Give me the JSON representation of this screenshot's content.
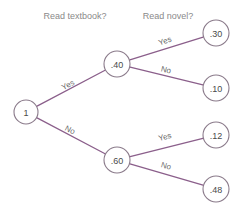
{
  "chart_data": {
    "type": "diagram",
    "diagram_kind": "probability-tree",
    "title": "",
    "column_headers": [
      {
        "label": "Read textbook?",
        "x": 75,
        "y": 17
      },
      {
        "label": "Read novel?",
        "x": 168,
        "y": 17
      }
    ],
    "nodes": [
      {
        "id": "root",
        "label": "1",
        "x": 26,
        "y": 112,
        "r": 12
      },
      {
        "id": "tb_yes",
        "label": ".40",
        "x": 117,
        "y": 64,
        "r": 13
      },
      {
        "id": "tb_no",
        "label": ".60",
        "x": 117,
        "y": 160,
        "r": 13
      },
      {
        "id": "leaf1",
        "label": ".30",
        "x": 216,
        "y": 33,
        "r": 13
      },
      {
        "id": "leaf2",
        "label": ".10",
        "x": 216,
        "y": 88,
        "r": 13
      },
      {
        "id": "leaf3",
        "label": ".12",
        "x": 216,
        "y": 135,
        "r": 13
      },
      {
        "id": "leaf4",
        "label": ".48",
        "x": 216,
        "y": 189,
        "r": 13
      }
    ],
    "edges": [
      {
        "id": "e-root-tbyes",
        "from": "root",
        "to": "tb_yes",
        "label": "Yes",
        "label_x": 68,
        "label_y": 85,
        "label_angle": -27
      },
      {
        "id": "e-root-tbno",
        "from": "root",
        "to": "tb_no",
        "label": "No",
        "label_x": 70,
        "label_y": 130,
        "label_angle": 27
      },
      {
        "id": "e-tbyes-l1",
        "from": "tb_yes",
        "to": "leaf1",
        "label": "Yes",
        "label_x": 165,
        "label_y": 41,
        "label_angle": -18
      },
      {
        "id": "e-tbyes-l2",
        "from": "tb_yes",
        "to": "leaf2",
        "label": "No",
        "label_x": 166,
        "label_y": 70,
        "label_angle": 14
      },
      {
        "id": "e-tbno-l3",
        "from": "tb_no",
        "to": "leaf3",
        "label": "Yes",
        "label_x": 165,
        "label_y": 137,
        "label_angle": -15
      },
      {
        "id": "e-tbno-l4",
        "from": "tb_no",
        "to": "leaf4",
        "label": "No",
        "label_x": 166,
        "label_y": 166,
        "label_angle": 16
      }
    ],
    "colors": {
      "edge": "#8b5f8b",
      "node_stroke": "#8a7a8a",
      "node_fill": "#ffffff",
      "header_text": "#8a8a8a",
      "node_text": "#4a4a4a",
      "edge_label_text": "#6a6a6a",
      "background": "#ffffff"
    }
  }
}
